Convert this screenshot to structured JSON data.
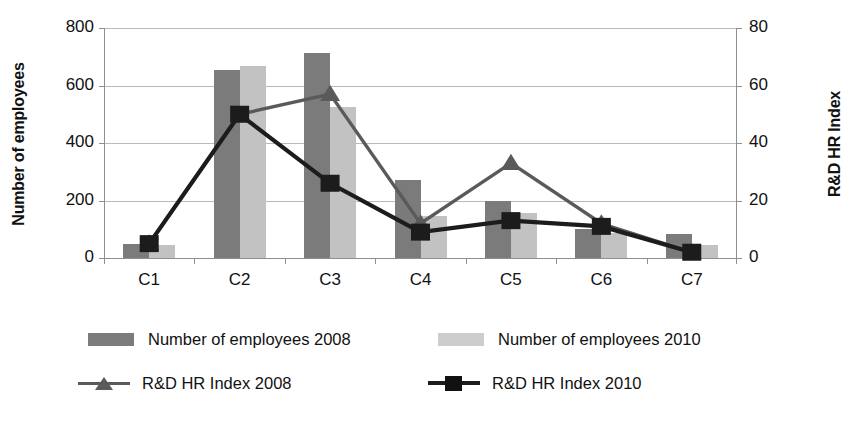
{
  "chart_data": {
    "type": "bar",
    "title": "",
    "subtitle": "",
    "categories": [
      "C1",
      "C2",
      "C3",
      "C4",
      "C5",
      "C6",
      "C7"
    ],
    "xlabel": "",
    "ylabel": "Number of employees",
    "y2label": "R&D HR Index",
    "ylim": [
      0,
      800
    ],
    "y2lim": [
      0,
      80
    ],
    "yticks": [
      "0",
      "200",
      "400",
      "600",
      "800"
    ],
    "ytick_values": [
      0,
      200,
      400,
      600,
      800
    ],
    "y2ticks": [
      "0",
      "20",
      "40",
      "60",
      "80"
    ],
    "y2tick_values": [
      0,
      20,
      40,
      60,
      80
    ],
    "grid": true,
    "legend_position": "bottom",
    "series": [
      {
        "name": "Number of employees 2008",
        "kind": "bar",
        "axis": "left",
        "color": "#7b7b7b",
        "values": [
          48,
          655,
          712,
          272,
          200,
          100,
          85
        ]
      },
      {
        "name": "Number of employees 2010",
        "kind": "bar",
        "axis": "left",
        "color": "#c2c2c2",
        "values": [
          47,
          667,
          525,
          145,
          155,
          88,
          45
        ]
      },
      {
        "name": "R&D HR Index 2008",
        "kind": "line",
        "axis": "right",
        "color": "#5a5a5a",
        "marker": "triangle",
        "values": [
          5,
          50,
          57,
          12,
          33,
          12,
          2
        ]
      },
      {
        "name": "R&D HR Index 2010",
        "kind": "line",
        "axis": "right",
        "color": "#1c1c1c",
        "marker": "square",
        "values": [
          5,
          50,
          26,
          9,
          13,
          11,
          2
        ]
      }
    ]
  },
  "legend": {
    "entries": [
      {
        "label": "Number of employees 2008",
        "swatch": "box-dark-grey"
      },
      {
        "label": "Number of employees 2010",
        "swatch": "box-light-grey"
      },
      {
        "label": "R&D HR Index 2008",
        "swatch": "line-triangle-grey"
      },
      {
        "label": "R&D HR Index 2010",
        "swatch": "line-square-black"
      }
    ]
  },
  "colors": {
    "bar_2008": "#7b7b7b",
    "bar_2010": "#c2c2c2",
    "line_2008": "#5a5a5a",
    "line_2010": "#1c1c1c",
    "gridline": "#b9b9b9",
    "axis": "#8f8f8f",
    "background": "#ffffff"
  }
}
